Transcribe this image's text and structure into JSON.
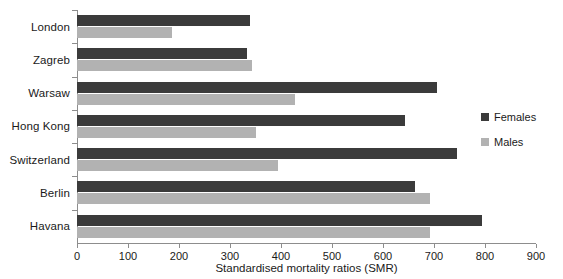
{
  "chart_data": {
    "type": "bar",
    "orientation": "horizontal",
    "title": "",
    "xlabel": "Standardised mortality ratios (SMR)",
    "ylabel": "",
    "xlim": [
      0,
      900
    ],
    "xticks": [
      0,
      100,
      200,
      300,
      400,
      500,
      600,
      700,
      800,
      900
    ],
    "grid": false,
    "legend_position": "right",
    "categories": [
      "London",
      "Zagreb",
      "Warsaw",
      "Hong Kong",
      "Switzerland",
      "Berlin",
      "Havana"
    ],
    "series": [
      {
        "name": "Females",
        "color": "#3b3b3b",
        "values": [
          340,
          334,
          705,
          644,
          746,
          663,
          795
        ]
      },
      {
        "name": "Males",
        "color": "#b2b2b2",
        "values": [
          187,
          344,
          428,
          350,
          395,
          693,
          693
        ]
      }
    ]
  },
  "legend": {
    "items": [
      {
        "label": "Females",
        "color": "#3b3b3b"
      },
      {
        "label": "Males",
        "color": "#b2b2b2"
      }
    ]
  },
  "axis": {
    "x_title": "Standardised mortality ratios (SMR)",
    "tick_labels": [
      "0",
      "100",
      "200",
      "300",
      "400",
      "500",
      "600",
      "700",
      "800",
      "900"
    ]
  },
  "categories": [
    "London",
    "Zagreb",
    "Warsaw",
    "Hong Kong",
    "Switzerland",
    "Berlin",
    "Havana"
  ]
}
